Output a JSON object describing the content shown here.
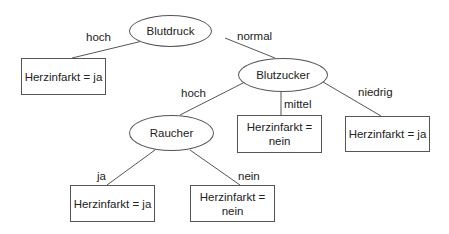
{
  "diagram": {
    "type": "decision-tree",
    "nodes": {
      "root": {
        "label": "Blutdruck",
        "shape": "ellipse"
      },
      "leaf_hoch": {
        "label": "Herzinfarkt = ja",
        "shape": "box"
      },
      "blutzucker": {
        "label": "Blutzucker",
        "shape": "ellipse"
      },
      "raucher": {
        "label": "Raucher",
        "shape": "ellipse"
      },
      "leaf_mittel": {
        "label": "Herzinfarkt = nein",
        "shape": "box"
      },
      "leaf_niedrig": {
        "label": "Herzinfarkt = ja",
        "shape": "box"
      },
      "leaf_ja": {
        "label": "Herzinfarkt = ja",
        "shape": "box"
      },
      "leaf_nein": {
        "label": "Herzinfarkt = nein",
        "shape": "box"
      }
    },
    "edges": {
      "root_hoch": {
        "from": "Blutdruck",
        "to": "Herzinfarkt = ja",
        "label": "hoch"
      },
      "root_normal": {
        "from": "Blutdruck",
        "to": "Blutzucker",
        "label": "normal"
      },
      "bz_hoch": {
        "from": "Blutzucker",
        "to": "Raucher",
        "label": "hoch"
      },
      "bz_mittel": {
        "from": "Blutzucker",
        "to": "Herzinfarkt = nein",
        "label": "mittel"
      },
      "bz_niedrig": {
        "from": "Blutzucker",
        "to": "Herzinfarkt = ja",
        "label": "niedrig"
      },
      "r_ja": {
        "from": "Raucher",
        "to": "Herzinfarkt = ja",
        "label": "ja"
      },
      "r_nein": {
        "from": "Raucher",
        "to": "Herzinfarkt = nein",
        "label": "nein"
      }
    }
  }
}
